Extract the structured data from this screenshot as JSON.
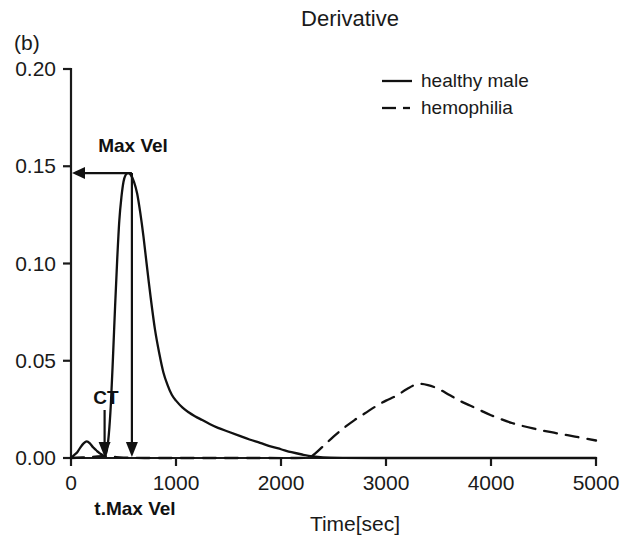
{
  "panel": {
    "label": "(b)"
  },
  "chart_data": {
    "type": "line",
    "title": "Derivative",
    "xlabel": "Time[sec]",
    "ylabel": "",
    "xlim": [
      0,
      5000
    ],
    "ylim": [
      0.0,
      0.2
    ],
    "grid": false,
    "legend_position": "top-right",
    "xticks": [
      0,
      1000,
      2000,
      3000,
      4000,
      5000
    ],
    "xticklabels": [
      "0",
      "1000",
      "2000",
      "3000",
      "4000",
      "5000"
    ],
    "yticks": [
      0.0,
      0.05,
      0.1,
      0.15,
      0.2
    ],
    "yticklabels": [
      "0.00",
      "0.05",
      "0.10",
      "0.15",
      "0.20"
    ],
    "series": [
      {
        "name": "healthy male",
        "style": "solid",
        "x": [
          0,
          30,
          60,
          90,
          120,
          150,
          180,
          210,
          240,
          260,
          280,
          300,
          320,
          340,
          360,
          380,
          400,
          420,
          440,
          460,
          480,
          500,
          520,
          545,
          570,
          600,
          630,
          660,
          690,
          720,
          760,
          800,
          840,
          880,
          920,
          960,
          1000,
          1060,
          1120,
          1180,
          1250,
          1320,
          1400,
          1500,
          1600,
          1700,
          1800,
          1900,
          2000,
          2100,
          2200,
          2300,
          2400,
          2600,
          2900,
          3300,
          3800,
          4400,
          5000
        ],
        "y": [
          0.0,
          0.0015,
          0.003,
          0.0055,
          0.0075,
          0.0085,
          0.0075,
          0.0055,
          0.004,
          0.003,
          0.0022,
          0.0015,
          0.0012,
          0.0035,
          0.012,
          0.028,
          0.052,
          0.078,
          0.102,
          0.122,
          0.134,
          0.142,
          0.1455,
          0.1465,
          0.1455,
          0.142,
          0.136,
          0.126,
          0.114,
          0.1,
          0.082,
          0.066,
          0.054,
          0.044,
          0.0375,
          0.0325,
          0.0295,
          0.026,
          0.0235,
          0.0215,
          0.0195,
          0.0175,
          0.0155,
          0.0135,
          0.0115,
          0.0095,
          0.0078,
          0.006,
          0.0045,
          0.003,
          0.0018,
          0.0008,
          0.0003,
          0.0001,
          0.0,
          0.0,
          0.0,
          0.0,
          0.0
        ]
      },
      {
        "name": "hemophilia",
        "style": "dashed",
        "x": [
          0,
          200,
          300,
          400,
          500,
          700,
          1000,
          1400,
          1800,
          2100,
          2250,
          2300,
          2400,
          2500,
          2600,
          2700,
          2800,
          2900,
          3000,
          3100,
          3200,
          3300,
          3400,
          3500,
          3600,
          3700,
          3800,
          3900,
          4000,
          4200,
          4400,
          4600,
          4800,
          5000
        ],
        "y": [
          0.0,
          0.0005,
          0.001,
          0.0006,
          0.0002,
          0.0,
          0.0,
          0.0,
          0.0,
          0.0,
          0.0002,
          0.0012,
          0.006,
          0.011,
          0.0155,
          0.0195,
          0.023,
          0.0265,
          0.0295,
          0.032,
          0.0355,
          0.038,
          0.0375,
          0.0355,
          0.0325,
          0.0295,
          0.027,
          0.0245,
          0.022,
          0.018,
          0.0152,
          0.013,
          0.011,
          0.009
        ]
      }
    ],
    "annotations": [
      {
        "name": "max-vel",
        "label": "Max Vel",
        "value": 0.1465,
        "kind": "horizontal-arrow"
      },
      {
        "name": "ct",
        "label": "CT",
        "value": 320,
        "kind": "vertical-arrow"
      },
      {
        "name": "t-max-vel",
        "label": "t.Max Vel",
        "value": 580,
        "kind": "vertical-arrow"
      }
    ]
  }
}
